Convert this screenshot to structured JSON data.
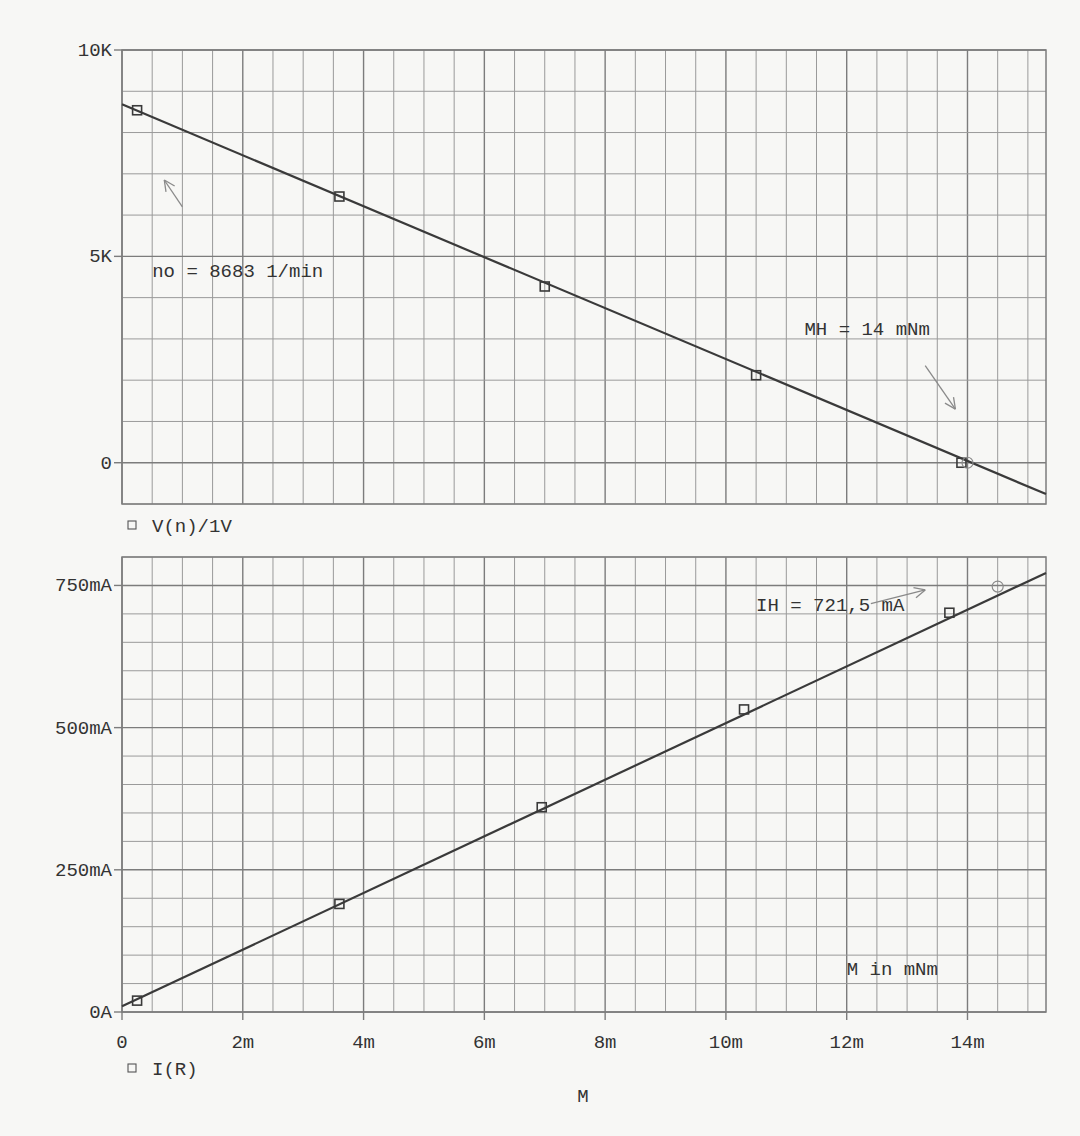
{
  "chart_data": [
    {
      "id": "speed",
      "type": "line",
      "title": "",
      "xlabel": "",
      "ylabel": "",
      "legend": "V(n)/1V",
      "xlim": [
        0,
        15.3
      ],
      "ylim": [
        -1000,
        10000
      ],
      "y_ticks": [
        {
          "value": 10000,
          "label": "10K"
        },
        {
          "value": 5000,
          "label": "5K"
        },
        {
          "value": 0,
          "label": "0"
        }
      ],
      "y_minor_step": 1000,
      "x_minor_step": 0.5,
      "x_major_step": 1,
      "line": {
        "x": [
          0,
          15.3
        ],
        "y": [
          8683,
          -760
        ]
      },
      "markers_square": [
        {
          "x": 0.25,
          "y": 8540
        },
        {
          "x": 3.6,
          "y": 6450
        },
        {
          "x": 7.0,
          "y": 4270
        },
        {
          "x": 10.5,
          "y": 2120
        },
        {
          "x": 13.9,
          "y": 0
        }
      ],
      "markers_circle": [
        {
          "x": 14.0,
          "y": 0
        }
      ],
      "annotations": [
        {
          "text": "no = 8683 1/min",
          "x": 0.5,
          "y": 4500
        },
        {
          "text": "MH = 14 mNm",
          "x": 11.3,
          "y": 3100
        }
      ],
      "arrows": [
        {
          "from": [
            1.0,
            6200
          ],
          "to": [
            0.7,
            6850
          ]
        },
        {
          "from": [
            13.3,
            2350
          ],
          "to": [
            13.8,
            1300
          ]
        }
      ]
    },
    {
      "id": "current",
      "type": "line",
      "title": "",
      "xlabel": "M",
      "ylabel": "",
      "legend": "I(R)",
      "xlim": [
        0,
        15.3
      ],
      "ylim": [
        0,
        800
      ],
      "y_ticks": [
        {
          "value": 750,
          "label": "750mA"
        },
        {
          "value": 500,
          "label": "500mA"
        },
        {
          "value": 250,
          "label": "250mA"
        },
        {
          "value": 0,
          "label": "0A"
        }
      ],
      "x_ticks": [
        {
          "value": 0,
          "label": "0"
        },
        {
          "value": 2,
          "label": "2m"
        },
        {
          "value": 4,
          "label": "4m"
        },
        {
          "value": 6,
          "label": "6m"
        },
        {
          "value": 8,
          "label": "8m"
        },
        {
          "value": 10,
          "label": "10m"
        },
        {
          "value": 12,
          "label": "12m"
        },
        {
          "value": 14,
          "label": "14m"
        }
      ],
      "y_minor_step": 50,
      "x_minor_step": 0.5,
      "x_major_step": 1,
      "line": {
        "x": [
          0,
          15.3
        ],
        "y": [
          10,
          772
        ]
      },
      "markers_square": [
        {
          "x": 0.25,
          "y": 20
        },
        {
          "x": 3.6,
          "y": 190
        },
        {
          "x": 6.95,
          "y": 360
        },
        {
          "x": 10.3,
          "y": 532
        },
        {
          "x": 13.7,
          "y": 702
        }
      ],
      "markers_circle": [
        {
          "x": 14.5,
          "y": 748
        }
      ],
      "annotations": [
        {
          "text": "IH = 721,5 mA",
          "x": 10.5,
          "y": 705
        },
        {
          "text": "M in mNm",
          "x": 12.0,
          "y": 65
        }
      ],
      "arrows": [
        {
          "from": [
            12.4,
            718
          ],
          "to": [
            13.3,
            742
          ]
        }
      ]
    }
  ],
  "layout": {
    "plots": [
      {
        "left": 122,
        "right": 1046,
        "top": 50,
        "bottom": 504,
        "legend_y": 532
      },
      {
        "left": 122,
        "right": 1046,
        "top": 557,
        "bottom": 1012,
        "legend_y": 1075,
        "xtick_y": 1048,
        "xlabel_y": 1102
      }
    ]
  },
  "colors": {
    "grid": "#9a9a9a",
    "grid_major": "#7c7c7c",
    "line": "#3a3a3a",
    "text": "#333333",
    "arrow": "#8a8a8a"
  }
}
